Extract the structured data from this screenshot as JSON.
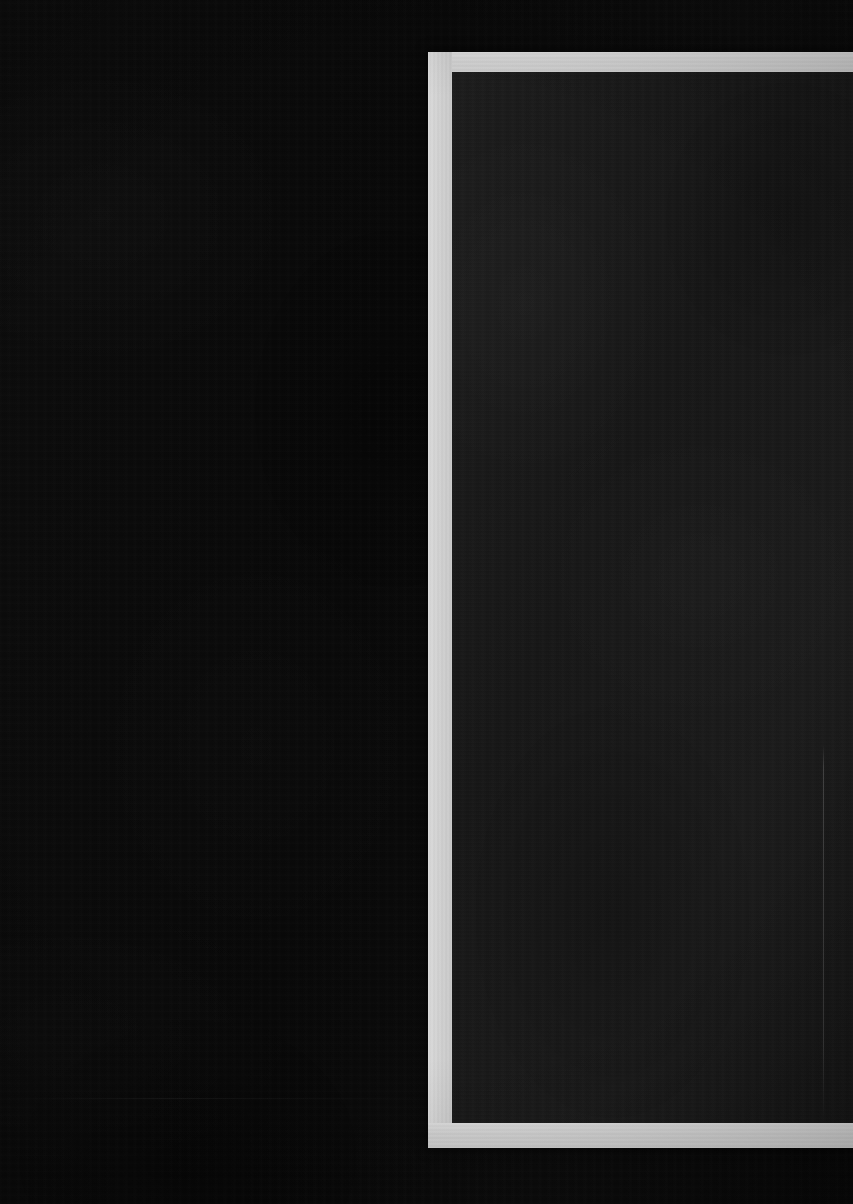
{
  "scene": {
    "title": "Dark frame photograph",
    "description": "Near-black low-light image; a light grey rectangular frame occupies the right portion and is cropped by the right edge of the picture.",
    "width_px": 853,
    "height_px": 1204,
    "background_color": "#0a0a0a",
    "visible_text": []
  },
  "frame": {
    "name": "light-rectangular-frame",
    "border_color": "#d4d4d4",
    "border_thickness_px": 24,
    "outer": {
      "left_px": 428,
      "top_px": 52,
      "right_px": 853,
      "bottom_px": 1148
    },
    "inner": {
      "left_px": 452,
      "top_px": 72,
      "right_px": 853,
      "bottom_px": 1123
    },
    "cropped_edge": "right",
    "interior_color": "#191919"
  },
  "interior": {
    "name": "dark-panel",
    "fill_color": "#191919",
    "seam": {
      "name": "vertical-seam",
      "x_px": 823,
      "top_px": 745,
      "bottom_px": 1120,
      "color": "#2a2a2a"
    }
  },
  "field": {
    "name": "left-black-field",
    "fill_color": "#080808",
    "left_px": 0,
    "top_px": 0,
    "right_px": 428,
    "bottom_px": 1204
  }
}
